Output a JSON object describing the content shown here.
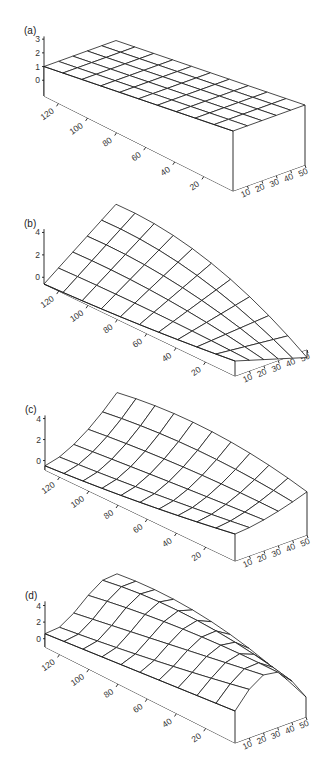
{
  "figure": {
    "panels": [
      {
        "id": "a",
        "label": "(a)"
      },
      {
        "id": "b",
        "label": "(b)"
      },
      {
        "id": "c",
        "label": "(c)"
      },
      {
        "id": "d",
        "label": "(d)"
      }
    ]
  },
  "chart_data": [
    {
      "type": "surface",
      "panel_label": "(a)",
      "title": "",
      "z_ticks": [
        "0",
        "1",
        "2",
        "3"
      ],
      "zlim": [
        -1.15,
        3.2
      ],
      "x_ticks": [
        "20",
        "40",
        "60",
        "80",
        "100",
        "120"
      ],
      "y_ticks": [
        "10",
        "20",
        "30",
        "40",
        "50"
      ],
      "xlim": [
        0,
        130
      ],
      "ylim": [
        0,
        50
      ],
      "grid": {
        "x_divisions": 10,
        "y_divisions": 5
      },
      "surface_description": "flat plane at z = 1",
      "z_at_corners": {
        "x0_y0": 1,
        "x130_y0": 1,
        "x0_y50": 1,
        "x130_y50": 1
      },
      "proj": {
        "base_back_left": [
          44,
          96
        ],
        "base_back_right": [
          116,
          70
        ],
        "base_front_left": [
          233,
          191
        ],
        "base_front_right": [
          305,
          165
        ],
        "zscale_back": 13.7,
        "zscale_front": 27.9
      }
    },
    {
      "type": "surface",
      "panel_label": "(b)",
      "title": "",
      "z_ticks": [
        "0",
        "2",
        "4"
      ],
      "zlim": [
        -0.6,
        4.3
      ],
      "x_ticks": [
        "20",
        "40",
        "60",
        "80",
        "100",
        "120"
      ],
      "y_ticks": [
        "10",
        "20",
        "30",
        "40",
        "50"
      ],
      "xlim": [
        0,
        130
      ],
      "ylim": [
        0,
        50
      ],
      "grid": {
        "x_divisions": 10,
        "y_divisions": 5
      },
      "surface_description": "linear ramp: z rises with y at the far (x=130) end, converging to ~0 at the near (x=0) end",
      "z_at_corners": {
        "x130_y0": -0.6,
        "x130_y50": 4.2,
        "x0_y0": 0,
        "x0_y50": 0
      },
      "proj": {
        "base_back_left": [
          44,
          284
        ],
        "base_back_right": [
          116,
          258
        ],
        "base_front_left": [
          235,
          376
        ],
        "base_front_right": [
          307,
          350
        ],
        "zscale_back": 11.2,
        "zscale_front": 25.0
      }
    },
    {
      "type": "surface",
      "panel_label": "(c)",
      "title": "",
      "z_ticks": [
        "0",
        "2",
        "4"
      ],
      "zlim": [
        -0.9,
        4.3
      ],
      "x_ticks": [
        "20",
        "40",
        "60",
        "80",
        "100",
        "120"
      ],
      "y_ticks": [
        "10",
        "20",
        "30",
        "40",
        "50"
      ],
      "xlim": [
        0,
        130
      ],
      "ylim": [
        0,
        50
      ],
      "grid": {
        "x_divisions": 10,
        "y_divisions": 5
      },
      "surface_description": "curved surface: concave rise along y (quadratic), amplitude decreasing toward x=0",
      "z_at_corners": {
        "x130_y0": -0.5,
        "x130_y50": 4.0,
        "x0_y0": 0.5,
        "x0_y50": 0.2
      },
      "proj": {
        "base_back_left": [
          45,
          470
        ],
        "base_back_right": [
          117,
          444
        ],
        "base_front_left": [
          235,
          561
        ],
        "base_front_right": [
          307,
          535
        ],
        "zscale_back": 10.5,
        "zscale_front": 24.0
      }
    },
    {
      "type": "surface",
      "panel_label": "(d)",
      "title": "",
      "z_ticks": [
        "0",
        "2",
        "4"
      ],
      "zlim": [
        -1.0,
        4.5
      ],
      "x_ticks": [
        "20",
        "40",
        "60",
        "80",
        "100",
        "120"
      ],
      "y_ticks": [
        "10",
        "20",
        "30",
        "40",
        "50"
      ],
      "xlim": [
        0,
        130
      ],
      "ylim": [
        0,
        50
      ],
      "grid": {
        "x_divisions": 10,
        "y_divisions": 5
      },
      "surface_description": "wavy surface: dip then ridge across y at far end, arched ridge at near end",
      "z_at_corners": {
        "x130_y0": 0.4,
        "x130_y50": 4.2,
        "x0_y0": 1.2,
        "x0_y50": 0.6
      },
      "proj": {
        "base_back_left": [
          45,
          647
        ],
        "base_back_right": [
          117,
          621
        ],
        "base_front_left": [
          235,
          743
        ],
        "base_front_right": [
          306,
          717
        ],
        "zscale_back": 8.3,
        "zscale_front": 20.0
      }
    }
  ]
}
